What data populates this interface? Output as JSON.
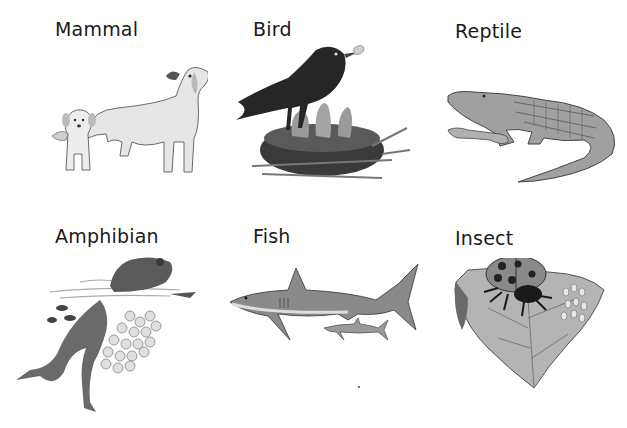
{
  "categories": [
    {
      "label": "Mammal",
      "depiction": "adult dog with puppy"
    },
    {
      "label": "Bird",
      "depiction": "bird feeding chicks in nest"
    },
    {
      "label": "Reptile",
      "depiction": "crocodile with baby crocodile"
    },
    {
      "label": "Amphibian",
      "depiction": "frog in water with frogspawn and tadpoles"
    },
    {
      "label": "Fish",
      "depiction": "shark with small shark"
    },
    {
      "label": "Insect",
      "depiction": "ladybird on leaf with eggs"
    }
  ],
  "colors": {
    "background": "#ffffff",
    "text": "#1a1a1a",
    "illustration_dark": "#2a2a2a",
    "illustration_mid": "#8a8a8a",
    "illustration_light": "#d8d8d8"
  }
}
